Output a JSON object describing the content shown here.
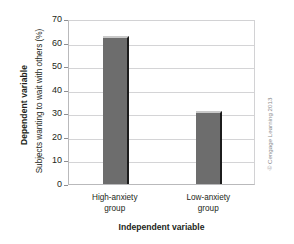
{
  "chart_data": {
    "type": "bar",
    "title": "",
    "categories": [
      "High-anxiety group",
      "Low-anxiety group"
    ],
    "values": [
      63,
      31
    ],
    "xlabel": "Independent variable",
    "ylabel": "Subjects wanting to wait with others (%)",
    "ylabel_group": "Dependent variable",
    "ylim": [
      0,
      70
    ],
    "ytick_values": [
      70,
      60,
      50,
      40,
      30,
      20,
      10,
      0
    ],
    "ytick_labels": [
      "70",
      "60",
      "50",
      "40",
      "30",
      "20",
      "10",
      "0"
    ],
    "grid": true,
    "legend": "none",
    "bar_color": "#6d6d6d",
    "grid_color": "#d4d4d6",
    "text_color": "#231f20"
  },
  "axes": {
    "y_group_label": "Dependent variable",
    "y_label": "Subjects wanting to wait with others (%)",
    "x_label": "Independent variable"
  },
  "categories": [
    {
      "line1": "High-anxiety",
      "line2": "group",
      "value": 63
    },
    {
      "line1": "Low-anxiety",
      "line2": "group",
      "value": 31
    }
  ],
  "yticks": [
    {
      "label": "70",
      "value": 70
    },
    {
      "label": "60",
      "value": 60
    },
    {
      "label": "50",
      "value": 50
    },
    {
      "label": "40",
      "value": 40
    },
    {
      "label": "30",
      "value": 30
    },
    {
      "label": "20",
      "value": 20
    },
    {
      "label": "10",
      "value": 10
    },
    {
      "label": "0",
      "value": 0
    }
  ],
  "credit": {
    "text": "© Cengage Learning 2013"
  }
}
